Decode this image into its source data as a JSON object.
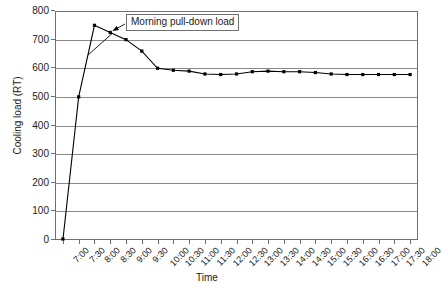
{
  "chart_data": {
    "type": "line",
    "title": "",
    "xlabel": "Time",
    "ylabel": "Cooling load (RT)",
    "ylim": [
      0,
      800
    ],
    "ytick_step": 100,
    "yticks": [
      0,
      100,
      200,
      300,
      400,
      500,
      600,
      700,
      800
    ],
    "grid": true,
    "legend": false,
    "marker": "square",
    "line_color": "#000000",
    "marker_color": "#000000",
    "grid_color": "#8a8a8a",
    "axis_color": "#6f6f6f",
    "categories": [
      "7:00",
      "7:30",
      "8:00",
      "8:30",
      "9:00",
      "9:30",
      "10:00",
      "10:30",
      "11:00",
      "11:30",
      "12:00",
      "12:30",
      "13:00",
      "13:30",
      "14:00",
      "14:30",
      "15:00",
      "15:30",
      "16:00",
      "16:30",
      "17:00",
      "17:30",
      "18:00"
    ],
    "values": [
      0,
      500,
      750,
      725,
      700,
      660,
      600,
      593,
      590,
      580,
      578,
      580,
      588,
      590,
      588,
      588,
      585,
      580,
      578,
      578,
      578,
      578,
      578
    ],
    "annotations": [
      {
        "text": "Morning pull-down load",
        "points_to": "8:30",
        "points_to_value": 725
      }
    ]
  },
  "annotation_label": "Morning pull-down load"
}
